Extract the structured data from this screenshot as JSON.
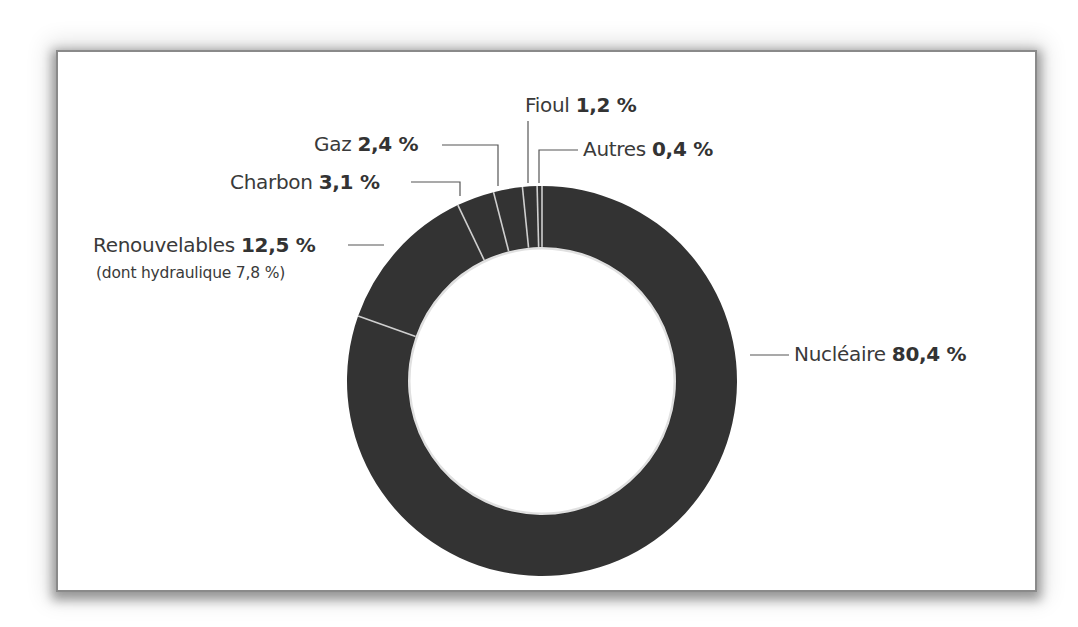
{
  "chart_data": {
    "type": "pie",
    "subtype": "donut",
    "title": "",
    "unit": "%",
    "categories": [
      "Nucléaire",
      "Renouvelables",
      "Charbon",
      "Gaz",
      "Fioul",
      "Autres"
    ],
    "values": [
      80.4,
      12.5,
      3.1,
      2.4,
      1.2,
      0.4
    ],
    "annotations": [
      {
        "category": "Renouvelables",
        "text": "(dont hydraulique 7,8 %)",
        "value": 7.8
      }
    ],
    "legend": "none (leader-line labels)",
    "colors": {
      "ring": "#333333",
      "separator": "#cfcfcf"
    }
  },
  "labels": {
    "nucleaire": {
      "name": "Nucléaire",
      "value": "80,4 %"
    },
    "renouvelables": {
      "name": "Renouvelables",
      "value": "12,5 %",
      "note": "(dont hydraulique 7,8 %)"
    },
    "charbon": {
      "name": "Charbon",
      "value": "3,1 %"
    },
    "gaz": {
      "name": "Gaz",
      "value": "2,4 %"
    },
    "fioul": {
      "name": "Fioul",
      "value": "1,2 %"
    },
    "autres": {
      "name": "Autres",
      "value": "0,4 %"
    }
  }
}
